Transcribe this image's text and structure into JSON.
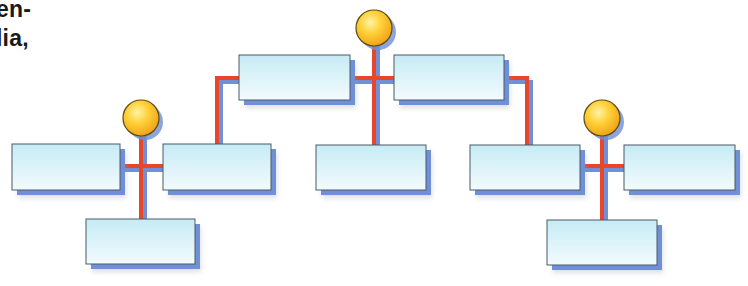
{
  "text_fragment": {
    "line1": "en-",
    "line2": "lia,"
  },
  "colors": {
    "connector": "#e8452a",
    "connector_shadow": "#6f8fd6",
    "box_fill_top": "#cdeef6",
    "box_fill_bottom": "#f4fbfd",
    "box_border": "#4a5a66",
    "box_shadow": "#6f8fd6",
    "node_fill": "#fcc52a",
    "node_highlight": "#fff0a0",
    "node_border": "#5a4a10"
  },
  "diagram": {
    "type": "org-chart",
    "nodes": [
      {
        "id": "top",
        "kind": "circle",
        "cx": 374,
        "cy": 28,
        "r": 18
      },
      {
        "id": "left",
        "kind": "circle",
        "cx": 141,
        "cy": 118,
        "r": 18
      },
      {
        "id": "right",
        "kind": "circle",
        "cx": 602,
        "cy": 118,
        "r": 18
      }
    ],
    "boxes": [
      {
        "id": "top-left",
        "x": 239,
        "y": 55,
        "w": 111,
        "h": 45,
        "label": ""
      },
      {
        "id": "top-right",
        "x": 394,
        "y": 55,
        "w": 110,
        "h": 45,
        "label": ""
      },
      {
        "id": "left-left",
        "x": 12,
        "y": 144,
        "w": 108,
        "h": 46,
        "label": ""
      },
      {
        "id": "left-right",
        "x": 163,
        "y": 144,
        "w": 108,
        "h": 46,
        "label": ""
      },
      {
        "id": "left-bottom",
        "x": 86,
        "y": 219,
        "w": 109,
        "h": 45,
        "label": ""
      },
      {
        "id": "middle",
        "x": 316,
        "y": 145,
        "w": 110,
        "h": 45,
        "label": ""
      },
      {
        "id": "right-left",
        "x": 470,
        "y": 145,
        "w": 110,
        "h": 45,
        "label": ""
      },
      {
        "id": "right-right",
        "x": 624,
        "y": 145,
        "w": 111,
        "h": 45,
        "label": ""
      },
      {
        "id": "right-bottom",
        "x": 547,
        "y": 220,
        "w": 110,
        "h": 45,
        "label": ""
      }
    ]
  }
}
